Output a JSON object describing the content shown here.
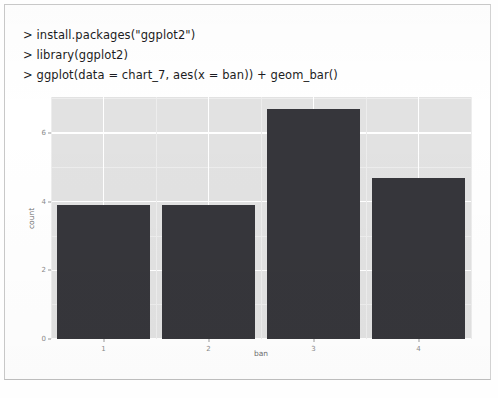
{
  "console": {
    "lines": [
      "> install.packages(\"ggplot2\")",
      "> library(ggplot2)",
      "> ggplot(data = chart_7, aes(x = ban)) + geom_bar()"
    ]
  },
  "chart_data": {
    "type": "bar",
    "title": "",
    "xlabel": "ban",
    "ylabel": "count",
    "categories": [
      "1",
      "2",
      "3",
      "4"
    ],
    "values": [
      3.9,
      3.9,
      6.7,
      4.7
    ],
    "ylim": [
      0,
      7.05
    ],
    "yticks": [
      "0",
      "2",
      "4",
      "6"
    ],
    "ytick_values": [
      0,
      2,
      4,
      6
    ],
    "xticks": [
      "1",
      "2",
      "3",
      "4"
    ],
    "grid": true,
    "legend": "none",
    "bar_color": "#36363b",
    "panel_color": "#e2e2e2",
    "gridline_color": "#ffffff"
  }
}
